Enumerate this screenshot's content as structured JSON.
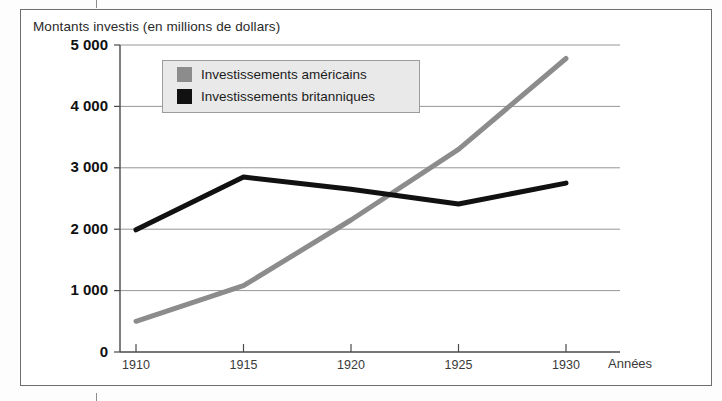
{
  "figure": {
    "title": "Montants investis (en millions de dollars)",
    "background": "#ffffff",
    "frame_color": "#6e6e6e"
  },
  "legend": {
    "position": "inside-top-left",
    "background": "#e9e9e9",
    "border": "#9c9c9c",
    "entries": [
      {
        "label": "Investissements américains",
        "color": "#8c8c8c"
      },
      {
        "label": "Investissements britanniques",
        "color": "#111111"
      }
    ]
  },
  "axes": {
    "y_tick_labels": [
      "5 000",
      "4 000",
      "3 000",
      "2 000",
      "1 000",
      "0"
    ],
    "x_tick_labels": [
      "1910",
      "1915",
      "1920",
      "1925",
      "1930"
    ],
    "x_axis_title": "Années",
    "y_axis_title": "Montants investis (en millions de dollars)"
  },
  "chart_data": {
    "type": "line",
    "title": "Montants investis (en millions de dollars)",
    "xlabel": "Années",
    "ylabel": "Montants investis (en millions de dollars)",
    "x": [
      1910,
      1915,
      1920,
      1925,
      1930
    ],
    "xlim": [
      1910,
      1930
    ],
    "ylim": [
      0,
      5000
    ],
    "yticks": [
      0,
      1000,
      2000,
      3000,
      4000,
      5000
    ],
    "xticks": [
      1910,
      1915,
      1920,
      1925,
      1930
    ],
    "grid": "horizontal",
    "legend_position": "upper left inside",
    "series": [
      {
        "name": "Investissements américains",
        "color": "#8c8c8c",
        "values": [
          500,
          1080,
          2150,
          3300,
          4780
        ]
      },
      {
        "name": "Investissements britanniques",
        "color": "#111111",
        "values": [
          1990,
          2850,
          2650,
          2410,
          2750
        ]
      }
    ]
  }
}
